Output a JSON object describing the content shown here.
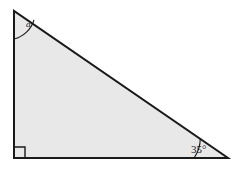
{
  "figure": {
    "background_color": "#ffffff",
    "fill_color": "#e8e8e8",
    "stroke_color": "#1a1a1a",
    "stroke_width": 2
  },
  "geometry": {
    "vertices": {
      "top_left": {
        "name": "A",
        "x": 14,
        "y": 11
      },
      "bottom_left": {
        "name": "B",
        "x": 14,
        "y": 158
      },
      "bottom_right": {
        "name": "C",
        "x": 228,
        "y": 158
      }
    },
    "path": "M 14 11 L 14 158 L 228 158 Z"
  },
  "labels": {
    "apex_angle": {
      "text": "a",
      "x": 26,
      "y": 27,
      "style": "italic"
    },
    "base_angle": {
      "text": "35°",
      "x": 191,
      "y": 153
    }
  },
  "markers": {
    "right_angle_square": {
      "x": 14,
      "y": 158,
      "size": 11,
      "path": "M 14 147 L 25 147 L 25 158"
    },
    "apex_arc": {
      "path": "M 14 39 A 28 28 0 0 0 34 20"
    },
    "base_arc": {
      "path": "M 194 158 A 34 34 0 0 0 200 138"
    }
  }
}
